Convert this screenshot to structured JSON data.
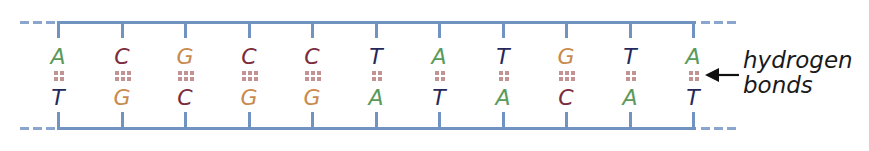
{
  "diagram": {
    "colors": {
      "backbone": "#7093c2",
      "hydrogen_bond": "#c39393",
      "A": "#5b9a5b",
      "T": "#25285a",
      "C": "#7a2c3c",
      "G": "#c98a4e",
      "label": "#1a1a1a"
    },
    "base_pairs": [
      {
        "top": "A",
        "bottom": "T",
        "bonds": 2
      },
      {
        "top": "C",
        "bottom": "G",
        "bonds": 3
      },
      {
        "top": "G",
        "bottom": "C",
        "bonds": 3
      },
      {
        "top": "C",
        "bottom": "G",
        "bonds": 3
      },
      {
        "top": "C",
        "bottom": "G",
        "bonds": 3
      },
      {
        "top": "T",
        "bottom": "A",
        "bonds": 2
      },
      {
        "top": "A",
        "bottom": "T",
        "bonds": 2
      },
      {
        "top": "T",
        "bottom": "A",
        "bonds": 2
      },
      {
        "top": "G",
        "bottom": "C",
        "bonds": 3
      },
      {
        "top": "T",
        "bottom": "A",
        "bonds": 2
      },
      {
        "top": "A",
        "bottom": "T",
        "bonds": 2
      }
    ],
    "annotation": {
      "line1": "hydrogen",
      "line2": "bonds",
      "icon": "left-arrow-icon"
    }
  }
}
